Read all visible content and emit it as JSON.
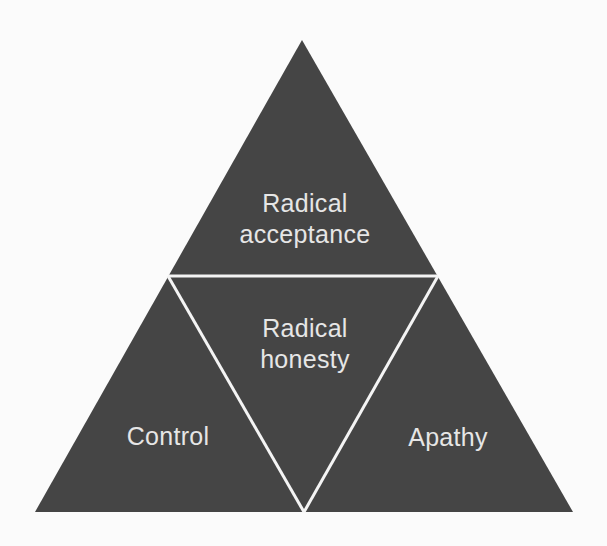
{
  "diagram": {
    "type": "triangle-of-four-subtriangles",
    "colors": {
      "background": "#fbfbfb",
      "triangle_fill": "#454545",
      "divider": "#f4f4f4",
      "text": "#e6e6e6"
    },
    "top": {
      "line1": "Radical",
      "line2": "acceptance"
    },
    "center": {
      "line1": "Radical",
      "line2": "honesty"
    },
    "bottom_left": {
      "label": "Control"
    },
    "bottom_right": {
      "label": "Apathy"
    }
  }
}
